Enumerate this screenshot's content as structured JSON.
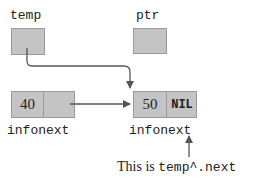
{
  "diagram": {
    "type": "linked-list pointer diagram",
    "pointers": [
      {
        "id": "temp",
        "label": "temp"
      },
      {
        "id": "ptr",
        "label": "ptr"
      }
    ],
    "nodes": [
      {
        "id": "node1",
        "info": "40",
        "next": "",
        "field_labels": "infonext"
      },
      {
        "id": "node2",
        "info": "50",
        "next": "NIL",
        "field_labels": "infonext"
      }
    ],
    "annotation": {
      "prefix": "This is ",
      "code": "temp^.next"
    },
    "colors": {
      "box_fill": "#c4c4c4",
      "box_border": "#9a9a9a",
      "arrow": "#555555",
      "text": "#222222"
    }
  }
}
